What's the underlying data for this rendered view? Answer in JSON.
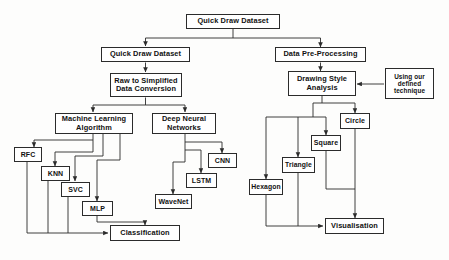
{
  "diagram": {
    "background_color": "#fdfdfc",
    "line_color": "#2b2b2b",
    "box_fill": "#ffffff",
    "text_color": "#111111"
  },
  "nodes": {
    "root": "Quick Draw Dataset",
    "left_branch": "Quick Draw Dataset",
    "right_branch": "Data Pre-Processing",
    "conversion": "Raw to Simplified Data Conversion",
    "ml": "Machine Learning Algorithm",
    "dnn": "Deep Neural Networks",
    "rfc": "RFC",
    "knn": "KNN",
    "svc": "SVC",
    "mlp": "MLP",
    "classification": "Classification",
    "cnn": "CNN",
    "lstm": "LSTM",
    "wavenet": "WaveNet",
    "drawing_style": "Drawing Style Analysis",
    "technique": "Using our defined technique",
    "circle": "Circle",
    "square": "Square",
    "triangle": "Triangle",
    "hexagon": "Hexagon",
    "visualisation": "Visualisation"
  }
}
